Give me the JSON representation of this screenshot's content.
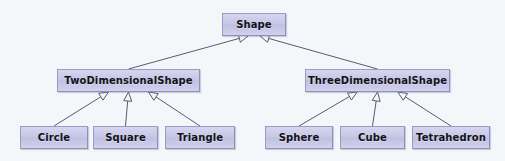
{
  "diagram": {
    "kind": "uml-class-diagram",
    "relationship": "generalization",
    "background_color": "#f4f7fa",
    "node_fill_color": "#c9c9e8",
    "node_border_color": "#9a9ac4",
    "edge_color": "#5a5a6e",
    "arrowhead": "hollow-triangle",
    "nodes": [
      {
        "id": "shape",
        "label": "Shape",
        "x": 222,
        "y": 13,
        "w": 64,
        "h": 23,
        "tier": "root"
      },
      {
        "id": "twod",
        "label": "TwoDimensionalShape",
        "x": 57,
        "y": 69,
        "w": 143,
        "h": 23,
        "tier": "mid"
      },
      {
        "id": "threed",
        "label": "ThreeDimensionalShape",
        "x": 305,
        "y": 69,
        "w": 145,
        "h": 23,
        "tier": "mid"
      },
      {
        "id": "circle",
        "label": "Circle",
        "x": 20,
        "y": 126,
        "w": 68,
        "h": 23,
        "tier": "leaf"
      },
      {
        "id": "square",
        "label": "Square",
        "x": 93,
        "y": 126,
        "w": 65,
        "h": 23,
        "tier": "leaf"
      },
      {
        "id": "triangle",
        "label": "Triangle",
        "x": 165,
        "y": 126,
        "w": 70,
        "h": 23,
        "tier": "leaf"
      },
      {
        "id": "sphere",
        "label": "Sphere",
        "x": 265,
        "y": 126,
        "w": 68,
        "h": 23,
        "tier": "leaf"
      },
      {
        "id": "cube",
        "label": "Cube",
        "x": 340,
        "y": 126,
        "w": 65,
        "h": 23,
        "tier": "leaf"
      },
      {
        "id": "tetrahedron",
        "label": "Tetrahedron",
        "x": 412,
        "y": 126,
        "w": 78,
        "h": 23,
        "tier": "leaf"
      }
    ],
    "edges": [
      {
        "from": "twod",
        "to": "shape",
        "type": "generalization"
      },
      {
        "from": "threed",
        "to": "shape",
        "type": "generalization"
      },
      {
        "from": "circle",
        "to": "twod",
        "type": "generalization"
      },
      {
        "from": "square",
        "to": "twod",
        "type": "generalization"
      },
      {
        "from": "triangle",
        "to": "twod",
        "type": "generalization"
      },
      {
        "from": "sphere",
        "to": "threed",
        "type": "generalization"
      },
      {
        "from": "cube",
        "to": "threed",
        "type": "generalization"
      },
      {
        "from": "tetrahedron",
        "to": "threed",
        "type": "generalization"
      }
    ]
  }
}
